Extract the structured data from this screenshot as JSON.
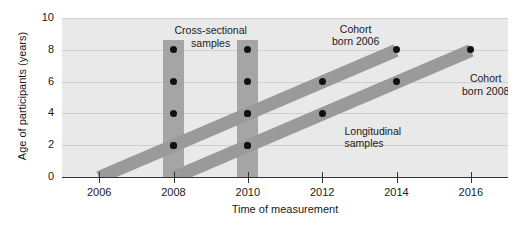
{
  "chart_data": {
    "type": "scatter",
    "title": "",
    "xlabel": "Time of measurement",
    "ylabel": "Age of participants (years)",
    "xlim": [
      2005,
      2017
    ],
    "ylim": [
      0,
      10
    ],
    "grid": true,
    "legend_position": "none",
    "x_ticks": [
      "2006",
      "2008",
      "2010",
      "2012",
      "2014",
      "2016"
    ],
    "x_tick_values": [
      2006,
      2008,
      2010,
      2012,
      2014,
      2016
    ],
    "y_ticks": [
      "0",
      "2",
      "4",
      "6",
      "8",
      "10"
    ],
    "y_tick_values": [
      0,
      2,
      4,
      6,
      8,
      10
    ],
    "series": [
      {
        "name": "Cohort born 2006",
        "kind": "band",
        "start": {
          "x": 2006,
          "y": 0
        },
        "end": {
          "x": 2014,
          "y": 8
        },
        "points": [
          {
            "x": 2008,
            "y": 2
          },
          {
            "x": 2010,
            "y": 4
          },
          {
            "x": 2012,
            "y": 6
          },
          {
            "x": 2014,
            "y": 8
          }
        ]
      },
      {
        "name": "Cohort born 2008",
        "kind": "band",
        "start": {
          "x": 2008,
          "y": 0
        },
        "end": {
          "x": 2016,
          "y": 8
        },
        "points": [
          {
            "x": 2010,
            "y": 2
          },
          {
            "x": 2012,
            "y": 4
          },
          {
            "x": 2014,
            "y": 6
          },
          {
            "x": 2016,
            "y": 8
          }
        ]
      },
      {
        "name": "Cross-sectional sample 2008",
        "kind": "bar",
        "x": 2008,
        "y_range": [
          0,
          8.6
        ],
        "points": [
          {
            "x": 2008,
            "y": 2
          },
          {
            "x": 2008,
            "y": 4
          },
          {
            "x": 2008,
            "y": 6
          },
          {
            "x": 2008,
            "y": 8
          }
        ]
      },
      {
        "name": "Cross-sectional sample 2010",
        "kind": "bar",
        "x": 2010,
        "y_range": [
          0,
          8.6
        ],
        "points": [
          {
            "x": 2010,
            "y": 2
          },
          {
            "x": 2010,
            "y": 4
          },
          {
            "x": 2010,
            "y": 6
          },
          {
            "x": 2010,
            "y": 8
          }
        ]
      }
    ],
    "annotations": [
      {
        "text": "Cross-sectional\nsamples",
        "x": 2009.0,
        "y": 9.6
      },
      {
        "text": "Cohort\nborn 2006",
        "x": 2012.9,
        "y": 9.7
      },
      {
        "text": "Cohort\nborn 2008",
        "x": 2016.4,
        "y": 6.6
      },
      {
        "text": "Longitudinal\nsamples",
        "x": 2012.6,
        "y": 3.3
      }
    ],
    "colors": {
      "plot_background": "#e9e9e9",
      "page_background": "#ffffff",
      "band": "#9a9a9a",
      "bar": "#9a9a9a",
      "dot": "#111111",
      "gridline": "#cfcfcf",
      "axis": "#333333",
      "text": "#1a1a1a"
    }
  },
  "axes": {
    "y_title": "Age of participants (years)",
    "x_title": "Time of measurement",
    "y_labels": [
      "10",
      "8",
      "6",
      "4",
      "2",
      "0"
    ],
    "x_labels": [
      "2006",
      "2008",
      "2010",
      "2012",
      "2014",
      "2016"
    ]
  },
  "annotations": {
    "cross_sectional": "Cross-sectional\nsamples",
    "cohort_2006": "Cohort\nborn 2006",
    "cohort_2008": "Cohort\nborn 2008",
    "longitudinal": "Longitudinal\nsamples"
  }
}
